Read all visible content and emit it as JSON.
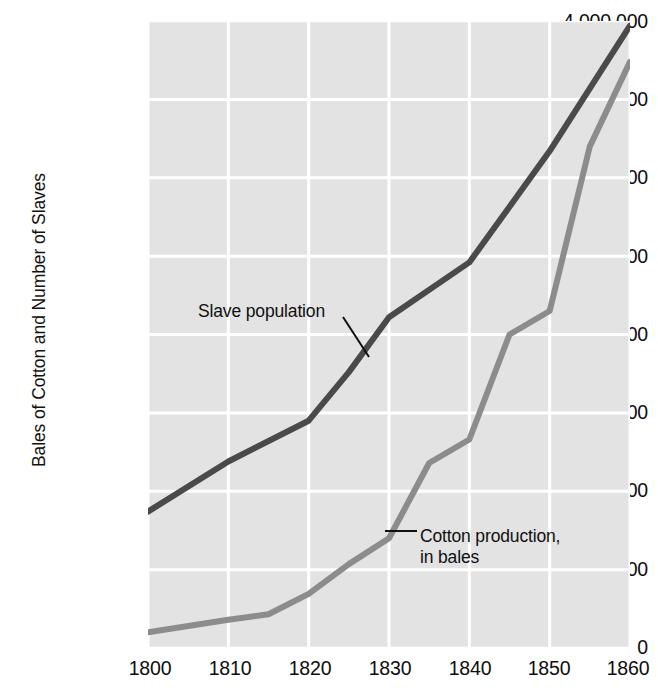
{
  "chart_data": {
    "type": "line",
    "title": "",
    "subtitle": "",
    "xlabel": "",
    "ylabel": "Bales of Cotton and Number of Slaves",
    "xlim": [
      1800,
      1860
    ],
    "ylim": [
      0,
      4000000
    ],
    "x_ticks": [
      "1800",
      "1810",
      "1820",
      "1830",
      "1840",
      "1850",
      "1860"
    ],
    "y_ticks": [
      "4,000,000",
      "3,500,000",
      "3,000,000",
      "2,500,000",
      "2,000,000",
      "1,500,000",
      "1,000,000",
      "500,000",
      "0"
    ],
    "grid": true,
    "grid_color": "#ffffff",
    "plot_bg": "#e3e3e3",
    "legend_position": "inline-annotations",
    "series": [
      {
        "name": "Slave population",
        "color": "#4a4a4a",
        "label_text": "Slave population",
        "points": [
          {
            "x": 1800,
            "y": 870000
          },
          {
            "x": 1810,
            "y": 1190000
          },
          {
            "x": 1820,
            "y": 1450000
          },
          {
            "x": 1825,
            "y": 1760000
          },
          {
            "x": 1830,
            "y": 2110000
          },
          {
            "x": 1840,
            "y": 2460000
          },
          {
            "x": 1850,
            "y": 3170000
          },
          {
            "x": 1860,
            "y": 3970000
          }
        ]
      },
      {
        "name": "Cotton production, in bales",
        "color": "#8c8c8c",
        "label_text": "Cotton production,\nin bales",
        "label_line1": "Cotton production,",
        "label_line2": "in bales",
        "points": [
          {
            "x": 1800,
            "y": 100000
          },
          {
            "x": 1810,
            "y": 180000
          },
          {
            "x": 1815,
            "y": 215000
          },
          {
            "x": 1820,
            "y": 345000
          },
          {
            "x": 1825,
            "y": 535000
          },
          {
            "x": 1830,
            "y": 700000
          },
          {
            "x": 1835,
            "y": 1180000
          },
          {
            "x": 1840,
            "y": 1330000
          },
          {
            "x": 1845,
            "y": 2000000
          },
          {
            "x": 1850,
            "y": 2150000
          },
          {
            "x": 1855,
            "y": 3200000
          },
          {
            "x": 1860,
            "y": 3740000
          }
        ]
      }
    ],
    "annotations": [
      {
        "name": "slave-population-label",
        "text": "Slave population",
        "leader": true
      },
      {
        "name": "cotton-production-label",
        "text": "Cotton production, in bales",
        "leader": true
      }
    ]
  }
}
